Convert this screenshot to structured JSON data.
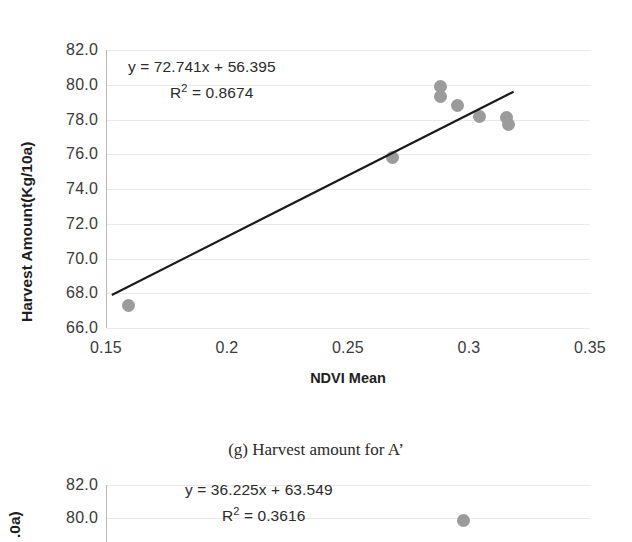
{
  "figure": {
    "caption": "(g) Harvest amount for A’"
  },
  "chart_data": [
    {
      "id": "main",
      "type": "scatter",
      "title": "",
      "xlabel": "NDVI Mean",
      "ylabel": "Harvest Amount(Kg/10a)",
      "xlim": [
        0.15,
        0.35
      ],
      "ylim": [
        66.0,
        82.0
      ],
      "xticks": [
        "0.15",
        "0.2",
        "0.25",
        "0.3",
        "0.35"
      ],
      "xtick_values": [
        0.15,
        0.2,
        0.25,
        0.3,
        0.35
      ],
      "yticks": [
        "66.0",
        "68.0",
        "70.0",
        "72.0",
        "74.0",
        "76.0",
        "78.0",
        "80.0",
        "82.0"
      ],
      "ytick_values": [
        66.0,
        68.0,
        70.0,
        72.0,
        74.0,
        76.0,
        78.0,
        80.0,
        82.0
      ],
      "grid": true,
      "legend": "none",
      "marker_color": "#9b9b9b",
      "trendline_color": "#1a1a1a",
      "annotations": {
        "equation": "y = 72.741x + 56.395",
        "r_squared": "R² = 0.8674",
        "slope": 72.741,
        "intercept": 56.395,
        "r2_value": 0.8674
      },
      "points": [
        {
          "x": 0.159,
          "y": 67.3
        },
        {
          "x": 0.268,
          "y": 75.8
        },
        {
          "x": 0.288,
          "y": 79.9
        },
        {
          "x": 0.288,
          "y": 79.3
        },
        {
          "x": 0.295,
          "y": 78.8
        },
        {
          "x": 0.304,
          "y": 78.2
        },
        {
          "x": 0.315,
          "y": 78.1
        },
        {
          "x": 0.316,
          "y": 77.7
        }
      ],
      "trendline": {
        "x1": 0.152,
        "y1": 67.9,
        "x2": 0.318,
        "y2": 79.6
      }
    },
    {
      "id": "second",
      "type": "scatter",
      "title": "",
      "xlabel": "",
      "ylabel": ".0a)",
      "ylim": [
        80.0,
        82.0
      ],
      "yticks": [
        "82.0",
        "80.0"
      ],
      "ytick_values": [
        82.0,
        80.0
      ],
      "grid": true,
      "legend": "none",
      "marker_color": "#9b9b9b",
      "annotations": {
        "equation": "y = 36.225x + 63.549",
        "r_squared": "R² = 0.3616",
        "slope": 36.225,
        "intercept": 63.549,
        "r2_value": 0.3616
      },
      "points": [
        {
          "x_px": 462,
          "y_px": 520
        }
      ]
    }
  ]
}
